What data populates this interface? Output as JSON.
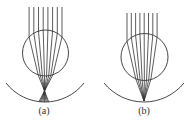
{
  "figure": {
    "stroke_color": "#333333",
    "panels": [
      {
        "id": "a",
        "label": "(a)",
        "label_x": 29,
        "sphere": {
          "cx": 45.5,
          "cy": 53,
          "r": 23
        },
        "rays": {
          "x": [
            29.1,
            33.8,
            38.5,
            43.2,
            47.9,
            52.6,
            57.3,
            62.0
          ],
          "top_y": 7,
          "exit_compress": 0.45
        },
        "focus": {
          "x": 44.5,
          "y": 91,
          "extend_to_y": 102
        },
        "screen_arc": {
          "x1": 6,
          "y1": 83,
          "x2": 84,
          "y2": 83,
          "r": 49.5
        }
      },
      {
        "id": "b",
        "label": "(b)",
        "label_x": 129,
        "sphere": {
          "cx": 144.5,
          "cy": 57,
          "r": 23.5
        },
        "rays": {
          "x": [
            127.0,
            131.3,
            135.6,
            139.9,
            144.2,
            148.5,
            152.8,
            157.1
          ],
          "top_y": 13,
          "exit_compress": 0.5
        },
        "focus": {
          "x": 144,
          "y": 101,
          "extend_to_y": 101
        },
        "screen_arc": {
          "x1": 104,
          "y1": 83,
          "x2": 184,
          "y2": 83,
          "r": 51.6
        }
      }
    ]
  }
}
